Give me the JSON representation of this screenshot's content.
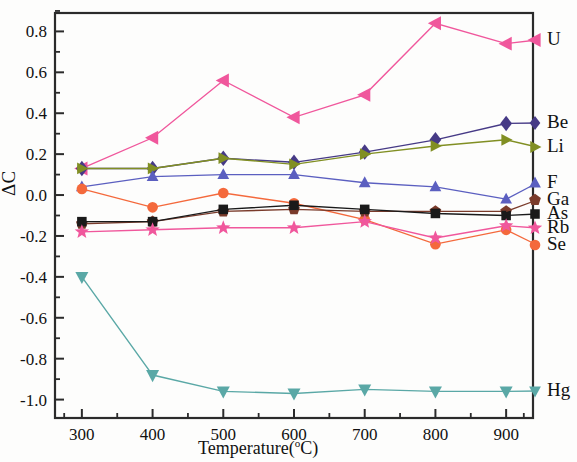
{
  "chart_data": {
    "type": "line",
    "title": "",
    "xlabel": "Temperature(°C)",
    "ylabel": "ΔC",
    "x": [
      300,
      400,
      500,
      600,
      700,
      800,
      900
    ],
    "xtick_labels": [
      "300",
      "400",
      "500",
      "600",
      "700",
      "800",
      "900"
    ],
    "ytick_labels": [
      "0.8",
      "0.6",
      "0.4",
      "0.2",
      "0.0",
      "-0.2",
      "-0.4",
      "-0.6",
      "-0.8",
      "-1.0"
    ],
    "ytick_values": [
      0.8,
      0.6,
      0.4,
      0.2,
      0.0,
      -0.2,
      -0.4,
      -0.6,
      -0.8,
      -1.0
    ],
    "xlim": [
      262,
      938
    ],
    "ylim": [
      -1.09,
      0.89
    ],
    "grid": false,
    "minor_ticks": true,
    "legend_position": "right-of-series-endpoints",
    "series": [
      {
        "name": "U",
        "label": "U",
        "color": "#f0579c",
        "marker": "triangle-left",
        "values": [
          0.13,
          0.28,
          0.56,
          0.38,
          0.49,
          0.84,
          0.74
        ]
      },
      {
        "name": "Be",
        "label": "Be",
        "color": "#463a86",
        "marker": "diamond",
        "values": [
          0.13,
          0.13,
          0.18,
          0.16,
          0.21,
          0.27,
          0.35
        ]
      },
      {
        "name": "Li",
        "label": "Li",
        "color": "#818f23",
        "marker": "triangle-right",
        "values": [
          0.13,
          0.13,
          0.18,
          0.15,
          0.2,
          0.24,
          0.27
        ]
      },
      {
        "name": "F",
        "label": "F",
        "color": "#5b5fc0",
        "marker": "triangle-up",
        "values": [
          0.04,
          0.09,
          0.1,
          0.1,
          0.06,
          0.04,
          -0.02
        ]
      },
      {
        "name": "Ga",
        "label": "Ga",
        "color": "#7a3b2b",
        "marker": "pentagon",
        "values": [
          -0.14,
          -0.13,
          -0.08,
          -0.07,
          -0.08,
          -0.08,
          -0.08
        ]
      },
      {
        "name": "As",
        "label": "As",
        "color": "#1a1a1a",
        "marker": "square",
        "values": [
          -0.13,
          -0.13,
          -0.07,
          -0.05,
          -0.07,
          -0.09,
          -0.1
        ]
      },
      {
        "name": "Rb",
        "label": "Rb",
        "color": "#f0579c",
        "marker": "star",
        "values": [
          -0.18,
          -0.17,
          -0.16,
          -0.16,
          -0.13,
          -0.21,
          -0.15
        ]
      },
      {
        "name": "Se",
        "label": "Se",
        "color": "#f4693c",
        "marker": "circle",
        "values": [
          0.03,
          -0.06,
          0.01,
          -0.04,
          -0.12,
          -0.24,
          -0.17
        ]
      },
      {
        "name": "Hg",
        "label": "Hg",
        "color": "#5aa8a6",
        "marker": "triangle-down",
        "values": [
          -0.4,
          -0.88,
          -0.96,
          -0.97,
          -0.95,
          -0.96,
          -0.96
        ]
      }
    ]
  },
  "axes": {
    "y_axis_title": "ΔC",
    "x_axis_title_prefix": "Temperature(",
    "x_axis_title_degree": "o",
    "x_axis_title_suffix": "C)"
  }
}
